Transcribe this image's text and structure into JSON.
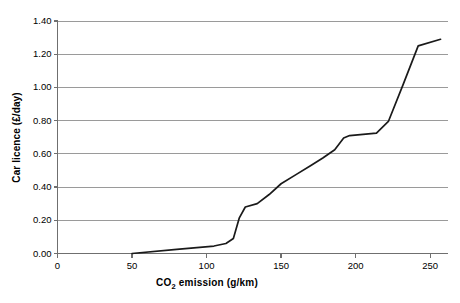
{
  "chart_data": {
    "type": "line",
    "title": "",
    "xlabel": "CO2 emission (g/km)",
    "xlabel_main": "CO",
    "xlabel_sub": "2",
    "xlabel_rest": " emission (g/km)",
    "ylabel": "Car licence (£/day)",
    "xlim": [
      0,
      262
    ],
    "ylim": [
      0.0,
      1.4
    ],
    "xticks": [
      0,
      50,
      100,
      150,
      200,
      250
    ],
    "xtick_labels": [
      "0",
      "50",
      "100",
      "150",
      "200",
      "250"
    ],
    "yticks": [
      0.0,
      0.2,
      0.4,
      0.6,
      0.8,
      1.0,
      1.2,
      1.4
    ],
    "ytick_labels": [
      "0.00",
      "0.20",
      "0.40",
      "0.60",
      "0.80",
      "1.00",
      "1.20",
      "1.40"
    ],
    "grid": "horizontal",
    "legend": "none",
    "series": [
      {
        "name": "Car licence vs CO2 emission",
        "color": "#1a1a1a",
        "points": [
          [
            50,
            0.0
          ],
          [
            80,
            0.025
          ],
          [
            105,
            0.045
          ],
          [
            113,
            0.06
          ],
          [
            118,
            0.09
          ],
          [
            122,
            0.215
          ],
          [
            126,
            0.28
          ],
          [
            134,
            0.3
          ],
          [
            142,
            0.355
          ],
          [
            150,
            0.42
          ],
          [
            160,
            0.475
          ],
          [
            170,
            0.53
          ],
          [
            178,
            0.575
          ],
          [
            186,
            0.625
          ],
          [
            192,
            0.695
          ],
          [
            196,
            0.71
          ],
          [
            214,
            0.725
          ],
          [
            222,
            0.795
          ],
          [
            232,
            1.02
          ],
          [
            242,
            1.25
          ],
          [
            257,
            1.29
          ]
        ]
      }
    ],
    "colors": {
      "line": "#1a1a1a",
      "grid": "#9a9a9a",
      "axis": "#6f6f6f",
      "background": "#ffffff",
      "text": "#000000"
    }
  }
}
